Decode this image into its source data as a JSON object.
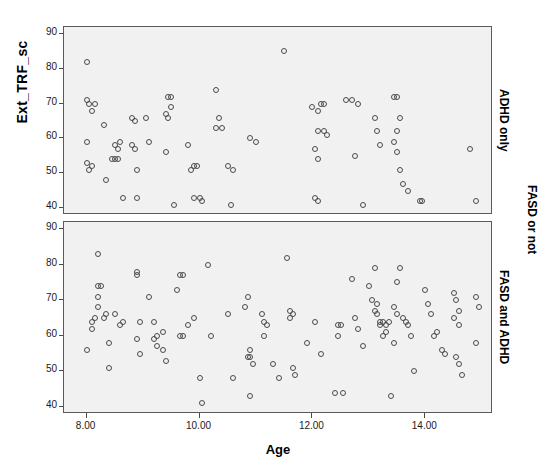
{
  "axes": {
    "y_title": "Ext_TRF_sc",
    "x_title": "Age",
    "y_ticks": [
      "40",
      "50",
      "60",
      "70",
      "80",
      "90"
    ],
    "x_ticks": [
      "8.00",
      "10.00",
      "12.00",
      "14.00"
    ]
  },
  "panels": {
    "top_label": "ADHD only",
    "bottom_label": "FASD and ADHD",
    "group_label": "FASD or not"
  },
  "colors": {
    "panel_background": "#f1f1f1",
    "panel_border": "#5a5a5a",
    "marker_stroke": "#4a4a4a",
    "text": "#000000"
  },
  "chart_data": {
    "type": "scatter",
    "title": "",
    "xlabel": "Age",
    "ylabel": "Ext_TRF_sc",
    "xlim": [
      7.6,
      15.2
    ],
    "ylim": [
      38,
      92
    ],
    "grid": false,
    "legend": "none",
    "facet_variable": "FASD or not",
    "panels": [
      {
        "name": "ADHD only",
        "points": [
          [
            8.0,
            82
          ],
          [
            8.0,
            71
          ],
          [
            8.05,
            70
          ],
          [
            8.15,
            70
          ],
          [
            8.1,
            68
          ],
          [
            8.0,
            59
          ],
          [
            8.0,
            53
          ],
          [
            8.1,
            52
          ],
          [
            8.05,
            51
          ],
          [
            8.3,
            64
          ],
          [
            8.35,
            48
          ],
          [
            8.5,
            58
          ],
          [
            8.55,
            57
          ],
          [
            8.6,
            59
          ],
          [
            8.5,
            54
          ],
          [
            8.55,
            54
          ],
          [
            8.45,
            54
          ],
          [
            8.65,
            43
          ],
          [
            8.8,
            66
          ],
          [
            8.85,
            65
          ],
          [
            8.8,
            58
          ],
          [
            8.85,
            57
          ],
          [
            8.9,
            51
          ],
          [
            8.9,
            43
          ],
          [
            9.05,
            66
          ],
          [
            9.1,
            59
          ],
          [
            9.45,
            72
          ],
          [
            9.5,
            72
          ],
          [
            9.4,
            67
          ],
          [
            9.45,
            66
          ],
          [
            9.5,
            69
          ],
          [
            9.4,
            56
          ],
          [
            9.55,
            41
          ],
          [
            9.8,
            58
          ],
          [
            9.85,
            51
          ],
          [
            9.9,
            52
          ],
          [
            9.95,
            52
          ],
          [
            9.9,
            43
          ],
          [
            10.0,
            43
          ],
          [
            10.05,
            42
          ],
          [
            10.3,
            74
          ],
          [
            10.35,
            66
          ],
          [
            10.3,
            63
          ],
          [
            10.4,
            63
          ],
          [
            10.5,
            52
          ],
          [
            10.6,
            51
          ],
          [
            10.55,
            41
          ],
          [
            10.9,
            60
          ],
          [
            11.0,
            59
          ],
          [
            11.5,
            85
          ],
          [
            12.0,
            69
          ],
          [
            12.1,
            68
          ],
          [
            12.15,
            70
          ],
          [
            12.2,
            70
          ],
          [
            12.1,
            62
          ],
          [
            12.2,
            62
          ],
          [
            12.25,
            61
          ],
          [
            12.05,
            57
          ],
          [
            12.1,
            54
          ],
          [
            12.05,
            43
          ],
          [
            12.1,
            42
          ],
          [
            12.6,
            71
          ],
          [
            12.7,
            71
          ],
          [
            12.8,
            70
          ],
          [
            12.75,
            55
          ],
          [
            12.9,
            41
          ],
          [
            13.1,
            66
          ],
          [
            13.15,
            62
          ],
          [
            13.2,
            58
          ],
          [
            13.45,
            72
          ],
          [
            13.5,
            72
          ],
          [
            13.55,
            66
          ],
          [
            13.5,
            62
          ],
          [
            13.45,
            59
          ],
          [
            13.5,
            56
          ],
          [
            13.55,
            51
          ],
          [
            13.6,
            47
          ],
          [
            13.7,
            45
          ],
          [
            13.9,
            42
          ],
          [
            13.95,
            42
          ],
          [
            14.8,
            57
          ],
          [
            14.9,
            42
          ]
        ]
      },
      {
        "name": "FASD and ADHD",
        "points": [
          [
            8.0,
            56
          ],
          [
            8.1,
            64
          ],
          [
            8.1,
            62
          ],
          [
            8.15,
            65
          ],
          [
            8.2,
            74
          ],
          [
            8.25,
            74
          ],
          [
            8.2,
            71
          ],
          [
            8.2,
            68
          ],
          [
            8.2,
            83
          ],
          [
            8.3,
            65
          ],
          [
            8.35,
            66
          ],
          [
            8.4,
            58
          ],
          [
            8.4,
            51
          ],
          [
            8.5,
            66
          ],
          [
            8.6,
            63
          ],
          [
            8.65,
            64
          ],
          [
            8.9,
            78
          ],
          [
            8.9,
            77
          ],
          [
            8.95,
            64
          ],
          [
            8.9,
            59
          ],
          [
            8.95,
            55
          ],
          [
            9.1,
            71
          ],
          [
            9.2,
            64
          ],
          [
            9.25,
            60
          ],
          [
            9.2,
            59
          ],
          [
            9.25,
            57
          ],
          [
            9.35,
            61
          ],
          [
            9.35,
            56
          ],
          [
            9.4,
            53
          ],
          [
            9.6,
            73
          ],
          [
            9.65,
            77
          ],
          [
            9.7,
            77
          ],
          [
            9.65,
            60
          ],
          [
            9.7,
            60
          ],
          [
            9.8,
            63
          ],
          [
            9.9,
            65
          ],
          [
            10.0,
            48
          ],
          [
            10.05,
            41
          ],
          [
            10.15,
            80
          ],
          [
            10.2,
            60
          ],
          [
            10.5,
            66
          ],
          [
            10.6,
            48
          ],
          [
            10.8,
            68
          ],
          [
            10.85,
            71
          ],
          [
            10.9,
            56
          ],
          [
            10.85,
            54
          ],
          [
            10.9,
            54
          ],
          [
            10.95,
            52
          ],
          [
            10.9,
            43
          ],
          [
            11.1,
            66
          ],
          [
            11.15,
            64
          ],
          [
            11.2,
            63
          ],
          [
            11.15,
            60
          ],
          [
            11.3,
            52
          ],
          [
            11.4,
            48
          ],
          [
            11.55,
            82
          ],
          [
            11.6,
            67
          ],
          [
            11.65,
            66
          ],
          [
            11.6,
            65
          ],
          [
            11.65,
            51
          ],
          [
            11.7,
            49
          ],
          [
            11.9,
            58
          ],
          [
            12.05,
            64
          ],
          [
            12.15,
            55
          ],
          [
            12.45,
            63
          ],
          [
            12.5,
            63
          ],
          [
            12.45,
            60
          ],
          [
            12.4,
            44
          ],
          [
            12.55,
            44
          ],
          [
            12.7,
            76
          ],
          [
            12.75,
            65
          ],
          [
            12.8,
            62
          ],
          [
            12.9,
            57
          ],
          [
            13.0,
            74
          ],
          [
            13.05,
            70
          ],
          [
            13.1,
            79
          ],
          [
            13.15,
            69
          ],
          [
            13.1,
            67
          ],
          [
            13.15,
            66
          ],
          [
            13.2,
            64
          ],
          [
            13.2,
            63
          ],
          [
            13.25,
            64
          ],
          [
            13.3,
            63
          ],
          [
            13.35,
            64
          ],
          [
            13.3,
            61
          ],
          [
            13.25,
            60
          ],
          [
            13.4,
            43
          ],
          [
            13.45,
            58
          ],
          [
            13.5,
            75
          ],
          [
            13.55,
            79
          ],
          [
            13.45,
            68
          ],
          [
            13.5,
            66
          ],
          [
            13.6,
            65
          ],
          [
            13.65,
            64
          ],
          [
            13.7,
            63
          ],
          [
            13.75,
            60
          ],
          [
            13.8,
            50
          ],
          [
            14.0,
            73
          ],
          [
            14.05,
            69
          ],
          [
            14.1,
            66
          ],
          [
            14.15,
            60
          ],
          [
            14.2,
            61
          ],
          [
            14.3,
            56
          ],
          [
            14.35,
            55
          ],
          [
            14.5,
            72
          ],
          [
            14.55,
            70
          ],
          [
            14.6,
            67
          ],
          [
            14.5,
            65
          ],
          [
            14.6,
            63
          ],
          [
            14.55,
            54
          ],
          [
            14.6,
            52
          ],
          [
            14.65,
            49
          ],
          [
            14.9,
            71
          ],
          [
            14.95,
            68
          ],
          [
            14.9,
            58
          ]
        ]
      }
    ]
  }
}
